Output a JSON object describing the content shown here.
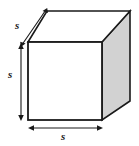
{
  "figure": {
    "name": "cube-with-edge-labels",
    "type": "geometric-solid-diagram",
    "shape": "cube",
    "background_color": "#ffffff",
    "labels": {
      "depth": "s",
      "height": "s",
      "width": "s"
    },
    "colors": {
      "outline": "#1a1a1a",
      "front_face": "#ffffff",
      "top_face": "#ffffff",
      "right_face": "#d2d2d2",
      "arrow": "#1a1a1a",
      "label_text": "#1a1a1a"
    },
    "geometry": {
      "front_top_left": [
        28,
        42
      ],
      "front_top_right": [
        102,
        42
      ],
      "front_bottom_left": [
        28,
        120
      ],
      "front_bottom_right": [
        102,
        120
      ],
      "back_top_left": [
        47,
        11
      ],
      "back_top_right": [
        130,
        11
      ],
      "back_bottom_right": [
        130,
        101
      ]
    },
    "arrows": {
      "depth_arrow": {
        "from": [
          22,
          45
        ],
        "to": [
          46,
          9
        ],
        "double_headed": true
      },
      "height_arrow": {
        "from": [
          21,
          44
        ],
        "to": [
          21,
          120
        ],
        "double_headed": true
      },
      "width_arrow": {
        "from": [
          29,
          128
        ],
        "to": [
          102,
          128
        ],
        "double_headed": true
      }
    }
  }
}
